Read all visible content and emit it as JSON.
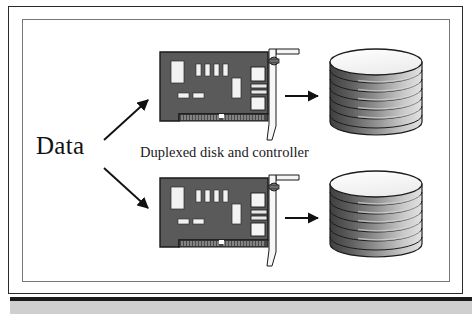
{
  "figure": {
    "title_label": "Data",
    "caption": "Duplexed disk and controller",
    "frame": {
      "outer_border_color": "#2a2a2a",
      "inner_border_color": "#777777",
      "background": "#ffffff",
      "bottom_rule_color": "#1b1b1b",
      "bottom_strip_color": "#cfcfcf"
    },
    "colors": {
      "card_body": "#5a5a5a",
      "card_outline": "#1a1a1a",
      "card_chip_light": "#f2f2f2",
      "card_connector": "#4a4a4a",
      "bracket": "#f5f5f5",
      "bracket_outline": "#1a1a1a",
      "disk_top": "#f7f7f7",
      "disk_edge_dark": "#4a4a4a",
      "disk_edge_light": "#d8d8d8",
      "disk_outline": "#1c1c1c",
      "arrow": "#111111"
    },
    "branches": [
      {
        "id": "upper",
        "controller_label": "disk-controller-card",
        "storage_label": "disk-platter-stack",
        "platter_count": 7,
        "feed_arrow": "diagonal-up-right",
        "link_arrow": "horizontal-right"
      },
      {
        "id": "lower",
        "controller_label": "disk-controller-card",
        "storage_label": "disk-platter-stack",
        "platter_count": 7,
        "feed_arrow": "diagonal-down-right",
        "link_arrow": "horizontal-right"
      }
    ],
    "card_components": {
      "large_chip": 1,
      "small_vertical_chips": 4,
      "right_vertical_chip": 1,
      "small_horizontal_chips": 2,
      "connector_teeth": 30
    }
  }
}
